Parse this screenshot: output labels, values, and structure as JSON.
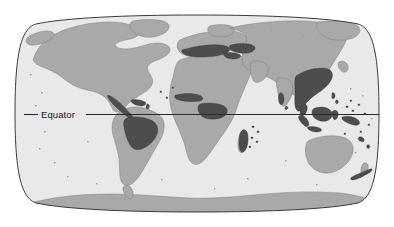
{
  "figure": {
    "type": "world-map",
    "projection": "Robinson",
    "title": "",
    "annotations": [
      {
        "name": "equator",
        "label": "Equator",
        "label_x": 62,
        "label_y": 118,
        "line_y": 114.5,
        "line_x_start": 24,
        "line_x_end": 379
      }
    ],
    "legend": [],
    "colors": {
      "background": "#ffffff",
      "ocean": "#e9e9e9",
      "land": "#a9a9a9",
      "highlight": "#4d4d4d",
      "outline": "#3a3a3a",
      "equator_line": "#2b2b2b",
      "label_text": "#1a1a1a"
    },
    "frame": {
      "left": 24,
      "right": 379,
      "top": 15,
      "bottom": 212
    },
    "regions_highlighted": [
      "Central America",
      "Caribbean",
      "Amazon Basin",
      "Madagascar",
      "Indochina",
      "Malay Peninsula",
      "Sumatra",
      "Borneo",
      "New Guinea",
      "Mediterranean"
    ]
  }
}
